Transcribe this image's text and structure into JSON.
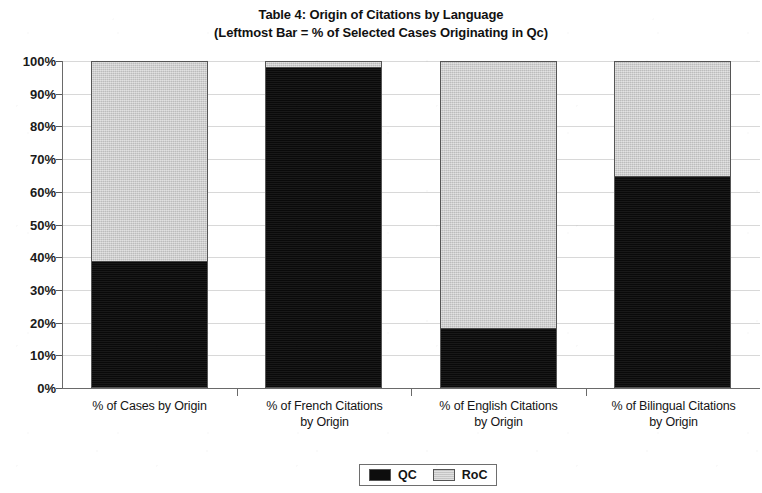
{
  "chart_data": {
    "type": "bar",
    "subtype": "stacked-100-percent",
    "title": "Table 4: Origin of Citations by Language",
    "subtitle": "(Leftmost Bar = % of Selected Cases Originating in Qc)",
    "xlabel": "",
    "ylabel": "",
    "ylim": [
      0,
      100
    ],
    "grid": true,
    "legend_position": "bottom-center",
    "categories": [
      "% of Cases by Origin",
      "% of French Citations by Origin",
      "% of English Citations by Origin",
      "% of Bilingual Citations by Origin"
    ],
    "category_lines": [
      [
        "% of Cases by Origin"
      ],
      [
        "% of French Citations",
        "by Origin"
      ],
      [
        "% of English Citations",
        "by Origin"
      ],
      [
        "% of Bilingual Citations",
        "by Origin"
      ]
    ],
    "series": [
      {
        "name": "QC",
        "color": "#0d0d0d",
        "values": [
          39,
          98.5,
          18.7,
          65
        ]
      },
      {
        "name": "RoC",
        "color": "#c9c9c9",
        "values": [
          61,
          1.5,
          81.3,
          35
        ]
      }
    ],
    "y_ticks": [
      {
        "value": 100,
        "label": "100%"
      },
      {
        "value": 90,
        "label": "90%"
      },
      {
        "value": 80,
        "label": "80%"
      },
      {
        "value": 70,
        "label": "70%"
      },
      {
        "value": 60,
        "label": "60%"
      },
      {
        "value": 50,
        "label": "50%"
      },
      {
        "value": 40,
        "label": "40%"
      },
      {
        "value": 30,
        "label": "30%"
      },
      {
        "value": 20,
        "label": "20%"
      },
      {
        "value": 10,
        "label": "10%"
      },
      {
        "value": 0,
        "label": "0%"
      }
    ]
  },
  "legend": {
    "items": [
      {
        "label": "QC",
        "swatch": "black-square-icon"
      },
      {
        "label": "RoC",
        "swatch": "gray-square-icon"
      }
    ]
  }
}
